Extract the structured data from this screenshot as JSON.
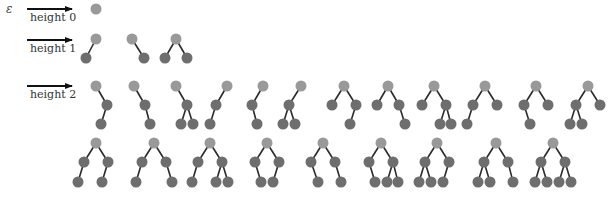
{
  "figure": {
    "epsilon_label": "ε",
    "colors": {
      "root": "#999999",
      "node": "#6e6e6e",
      "edge": "#2a2a2a",
      "arrow": "#111111",
      "text": "#333333"
    },
    "node_radius": 5.5,
    "levels": [
      {
        "label": "height 0",
        "arrow": {
          "x1": 27,
          "x2": 72,
          "y": 9
        },
        "label_pos": {
          "x": 30,
          "y": 21
        },
        "trees": [
          {
            "nodes": [
              [
                96,
                9
              ]
            ],
            "edges": []
          }
        ]
      },
      {
        "label": "height 1",
        "arrow": {
          "x1": 27,
          "x2": 72,
          "y": 40
        },
        "label_pos": {
          "x": 30,
          "y": 52
        },
        "trees": [
          {
            "nodes": [
              [
                96,
                39
              ],
              [
                86,
                58
              ]
            ],
            "edges": [
              [
                0,
                1
              ]
            ]
          },
          {
            "nodes": [
              [
                132,
                39
              ],
              [
                144,
                58
              ]
            ],
            "edges": [
              [
                0,
                1
              ]
            ]
          },
          {
            "nodes": [
              [
                176,
                39
              ],
              [
                165,
                58
              ],
              [
                187,
                58
              ]
            ],
            "edges": [
              [
                0,
                1
              ],
              [
                0,
                2
              ]
            ]
          }
        ]
      },
      {
        "label": "height 2",
        "arrow": {
          "x1": 27,
          "x2": 72,
          "y": 86
        },
        "label_pos": {
          "x": 30,
          "y": 98
        },
        "trees": [
          {
            "nodes": [
              [
                96,
                86
              ],
              [
                107,
                105
              ],
              [
                101,
                124
              ]
            ],
            "edges": [
              [
                0,
                1
              ],
              [
                1,
                2
              ]
            ]
          },
          {
            "nodes": [
              [
                134,
                86
              ],
              [
                145,
                105
              ],
              [
                150,
                124
              ]
            ],
            "edges": [
              [
                0,
                1
              ],
              [
                1,
                2
              ]
            ]
          },
          {
            "nodes": [
              [
                176,
                86
              ],
              [
                187,
                105
              ],
              [
                181,
                124
              ],
              [
                193,
                124
              ]
            ],
            "edges": [
              [
                0,
                1
              ],
              [
                1,
                2
              ],
              [
                1,
                3
              ]
            ]
          },
          {
            "nodes": [
              [
                227,
                86
              ],
              [
                216,
                105
              ],
              [
                210,
                124
              ]
            ],
            "edges": [
              [
                0,
                1
              ],
              [
                1,
                2
              ]
            ]
          },
          {
            "nodes": [
              [
                263,
                86
              ],
              [
                252,
                105
              ],
              [
                257,
                124
              ]
            ],
            "edges": [
              [
                0,
                1
              ],
              [
                1,
                2
              ]
            ]
          },
          {
            "nodes": [
              [
                301,
                86
              ],
              [
                289,
                105
              ],
              [
                283,
                124
              ],
              [
                295,
                124
              ]
            ],
            "edges": [
              [
                0,
                1
              ],
              [
                1,
                2
              ],
              [
                1,
                3
              ]
            ]
          },
          {
            "nodes": [
              [
                344,
                86
              ],
              [
                332,
                105
              ],
              [
                356,
                105
              ],
              [
                350,
                124
              ]
            ],
            "edges": [
              [
                0,
                1
              ],
              [
                0,
                2
              ],
              [
                2,
                3
              ]
            ]
          },
          {
            "nodes": [
              [
                388,
                86
              ],
              [
                377,
                105
              ],
              [
                399,
                105
              ],
              [
                405,
                124
              ]
            ],
            "edges": [
              [
                0,
                1
              ],
              [
                0,
                2
              ],
              [
                2,
                3
              ]
            ]
          },
          {
            "nodes": [
              [
                434,
                86
              ],
              [
                422,
                105
              ],
              [
                446,
                105
              ],
              [
                440,
                124
              ],
              [
                451,
                124
              ]
            ],
            "edges": [
              [
                0,
                1
              ],
              [
                0,
                2
              ],
              [
                2,
                3
              ],
              [
                2,
                4
              ]
            ]
          },
          {
            "nodes": [
              [
                485,
                86
              ],
              [
                473,
                105
              ],
              [
                497,
                105
              ],
              [
                467,
                124
              ]
            ],
            "edges": [
              [
                0,
                1
              ],
              [
                0,
                2
              ],
              [
                1,
                3
              ]
            ]
          },
          {
            "nodes": [
              [
                536,
                86
              ],
              [
                524,
                105
              ],
              [
                548,
                105
              ],
              [
                530,
                124
              ]
            ],
            "edges": [
              [
                0,
                1
              ],
              [
                0,
                2
              ],
              [
                1,
                3
              ]
            ]
          },
          {
            "nodes": [
              [
                588,
                86
              ],
              [
                576,
                105
              ],
              [
                600,
                105
              ],
              [
                570,
                124
              ],
              [
                582,
                124
              ]
            ],
            "edges": [
              [
                0,
                1
              ],
              [
                0,
                2
              ],
              [
                1,
                3
              ],
              [
                1,
                4
              ]
            ]
          },
          {
            "nodes": [
              [
                96,
                143
              ],
              [
                84,
                162
              ],
              [
                108,
                162
              ],
              [
                78,
                182
              ],
              [
                102,
                182
              ]
            ],
            "edges": [
              [
                0,
                1
              ],
              [
                0,
                2
              ],
              [
                1,
                3
              ],
              [
                2,
                4
              ]
            ]
          },
          {
            "nodes": [
              [
                154,
                143
              ],
              [
                142,
                162
              ],
              [
                166,
                162
              ],
              [
                136,
                182
              ],
              [
                172,
                182
              ]
            ],
            "edges": [
              [
                0,
                1
              ],
              [
                0,
                2
              ],
              [
                1,
                3
              ],
              [
                2,
                4
              ]
            ]
          },
          {
            "nodes": [
              [
                210,
                143
              ],
              [
                198,
                162
              ],
              [
                222,
                162
              ],
              [
                192,
                182
              ],
              [
                216,
                182
              ],
              [
                228,
                182
              ]
            ],
            "edges": [
              [
                0,
                1
              ],
              [
                0,
                2
              ],
              [
                1,
                3
              ],
              [
                2,
                4
              ],
              [
                2,
                5
              ]
            ]
          },
          {
            "nodes": [
              [
                267,
                143
              ],
              [
                255,
                162
              ],
              [
                279,
                162
              ],
              [
                261,
                182
              ],
              [
                273,
                182
              ]
            ],
            "edges": [
              [
                0,
                1
              ],
              [
                0,
                2
              ],
              [
                1,
                3
              ],
              [
                2,
                4
              ]
            ]
          },
          {
            "nodes": [
              [
                323,
                143
              ],
              [
                311,
                162
              ],
              [
                335,
                162
              ],
              [
                318,
                182
              ],
              [
                341,
                182
              ]
            ],
            "edges": [
              [
                0,
                1
              ],
              [
                0,
                2
              ],
              [
                1,
                3
              ],
              [
                2,
                4
              ]
            ]
          },
          {
            "nodes": [
              [
                381,
                143
              ],
              [
                369,
                162
              ],
              [
                393,
                162
              ],
              [
                375,
                182
              ],
              [
                387,
                182
              ],
              [
                398,
                182
              ]
            ],
            "edges": [
              [
                0,
                1
              ],
              [
                0,
                2
              ],
              [
                1,
                3
              ],
              [
                2,
                4
              ],
              [
                2,
                5
              ]
            ]
          },
          {
            "nodes": [
              [
                437,
                143
              ],
              [
                425,
                162
              ],
              [
                449,
                162
              ],
              [
                419,
                182
              ],
              [
                431,
                182
              ],
              [
                443,
                182
              ]
            ],
            "edges": [
              [
                0,
                1
              ],
              [
                0,
                2
              ],
              [
                1,
                3
              ],
              [
                1,
                4
              ],
              [
                2,
                5
              ]
            ]
          },
          {
            "nodes": [
              [
                496,
                143
              ],
              [
                484,
                162
              ],
              [
                508,
                162
              ],
              [
                478,
                182
              ],
              [
                490,
                182
              ],
              [
                513,
                182
              ]
            ],
            "edges": [
              [
                0,
                1
              ],
              [
                0,
                2
              ],
              [
                1,
                3
              ],
              [
                1,
                4
              ],
              [
                2,
                5
              ]
            ]
          },
          {
            "nodes": [
              [
                553,
                143
              ],
              [
                541,
                162
              ],
              [
                565,
                162
              ],
              [
                535,
                182
              ],
              [
                547,
                182
              ],
              [
                559,
                182
              ],
              [
                571,
                182
              ]
            ],
            "edges": [
              [
                0,
                1
              ],
              [
                0,
                2
              ],
              [
                1,
                3
              ],
              [
                1,
                4
              ],
              [
                2,
                5
              ],
              [
                2,
                6
              ]
            ]
          }
        ]
      }
    ]
  }
}
